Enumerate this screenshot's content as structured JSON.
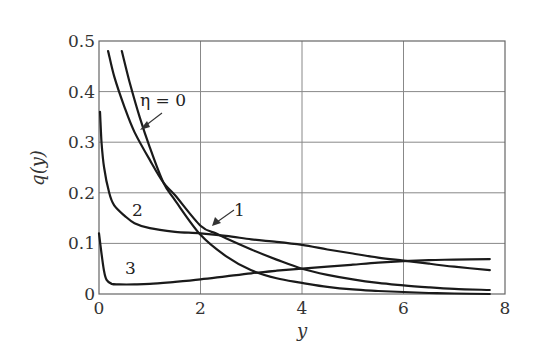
{
  "chart_data": {
    "type": "line",
    "title": "",
    "xlabel": "y",
    "ylabel": "q(y)",
    "xlim": [
      0,
      8
    ],
    "ylim": [
      0,
      0.5
    ],
    "xticks": [
      0,
      2,
      4,
      6,
      8
    ],
    "xtick_labels": [
      "0",
      "2",
      "4",
      "6",
      "8"
    ],
    "yticks": [
      0,
      0.1,
      0.2,
      0.3,
      0.4,
      0.5
    ],
    "ytick_labels": [
      "0",
      "0.1",
      "0.2",
      "0.3",
      "0.4",
      "0.5"
    ],
    "grid": true,
    "legend": "none (curves labeled inline)",
    "series": [
      {
        "name": "η = 0",
        "label": "η = 0",
        "x": [
          0.45,
          0.6,
          0.8,
          1.0,
          1.27,
          1.5,
          2.0,
          2.5,
          3.0,
          3.5,
          4.0,
          4.5,
          5.0,
          5.5,
          6.0,
          6.5,
          7.0,
          7.7
        ],
        "y": [
          0.48,
          0.42,
          0.35,
          0.29,
          0.22,
          0.185,
          0.117,
          0.075,
          0.047,
          0.031,
          0.022,
          0.014,
          0.009,
          0.006,
          0.004,
          0.002,
          0.001,
          0.0
        ]
      },
      {
        "name": "1",
        "label": "1",
        "x": [
          0.18,
          0.3,
          0.5,
          0.7,
          1.0,
          1.27,
          1.5,
          2.0,
          2.3,
          2.5,
          3.0,
          3.5,
          4.0,
          4.5,
          5.0,
          5.5,
          6.0,
          6.5,
          7.0,
          7.7
        ],
        "y": [
          0.48,
          0.43,
          0.37,
          0.32,
          0.265,
          0.22,
          0.195,
          0.135,
          0.12,
          0.11,
          0.088,
          0.068,
          0.05,
          0.038,
          0.029,
          0.022,
          0.017,
          0.013,
          0.01,
          0.008
        ]
      },
      {
        "name": "2",
        "label": "2",
        "x": [
          0.02,
          0.05,
          0.1,
          0.2,
          0.3,
          0.5,
          0.7,
          1.0,
          1.5,
          2.0,
          2.5,
          3.0,
          3.5,
          4.0,
          4.5,
          5.0,
          5.5,
          6.0,
          6.5,
          7.0,
          7.7
        ],
        "y": [
          0.36,
          0.3,
          0.25,
          0.2,
          0.175,
          0.155,
          0.14,
          0.13,
          0.123,
          0.12,
          0.115,
          0.108,
          0.103,
          0.097,
          0.088,
          0.08,
          0.072,
          0.066,
          0.06,
          0.054,
          0.047
        ]
      },
      {
        "name": "3",
        "label": "3",
        "x": [
          0.0,
          0.05,
          0.1,
          0.15,
          0.25,
          0.4,
          0.7,
          1.0,
          1.5,
          2.0,
          2.5,
          3.0,
          3.5,
          4.0,
          4.5,
          5.0,
          5.5,
          6.0,
          6.5,
          7.0,
          7.7
        ],
        "y": [
          0.12,
          0.08,
          0.045,
          0.028,
          0.02,
          0.019,
          0.019,
          0.02,
          0.024,
          0.029,
          0.035,
          0.041,
          0.046,
          0.05,
          0.054,
          0.058,
          0.062,
          0.065,
          0.067,
          0.068,
          0.069
        ]
      }
    ],
    "annotations": [
      {
        "text": "η = 0",
        "arrow_to_series": "η = 0"
      },
      {
        "text": "1",
        "arrow_to_series": "1"
      },
      {
        "text": "2"
      },
      {
        "text": "3"
      }
    ]
  },
  "labels": {
    "x_axis": "y",
    "y_axis": "q(y)",
    "eta0": "η = 0",
    "c1": "1",
    "c2": "2",
    "c3": "3"
  }
}
